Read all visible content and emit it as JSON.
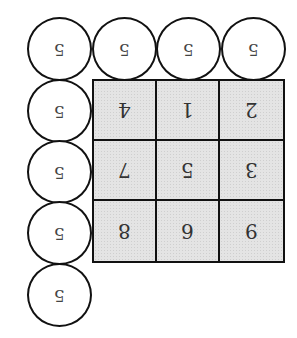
{
  "diagram": {
    "orientation": "rotated 180 degrees",
    "grid": {
      "rows": 3,
      "cols": 3,
      "fill": "#e4e4e4",
      "cells": [
        [
          "4",
          "1",
          "2"
        ],
        [
          "7",
          "5",
          "3"
        ],
        [
          "8",
          "6",
          "9"
        ]
      ]
    },
    "top_circles": [
      "5",
      "5",
      "5",
      "5"
    ],
    "left_circles": [
      "5",
      "5",
      "5",
      "5"
    ],
    "border_color": "#111111"
  }
}
